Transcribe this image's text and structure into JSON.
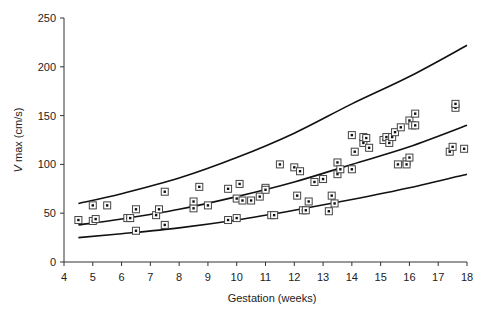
{
  "chart_data": {
    "type": "scatter",
    "title": "",
    "xlabel": "Gestation (weeks)",
    "ylabel_italic": "V",
    "ylabel_rest": " max (cm/s)",
    "ylabel": "V max (cm/s)",
    "xlim": [
      4,
      18
    ],
    "ylim": [
      0,
      250
    ],
    "xticks": [
      4,
      5,
      6,
      7,
      8,
      9,
      10,
      11,
      12,
      13,
      14,
      15,
      16,
      17,
      18
    ],
    "yticks": [
      0,
      50,
      100,
      150,
      200,
      250
    ],
    "grid": false,
    "legend": null,
    "marker": "square-with-dot",
    "series": [
      {
        "name": "observations",
        "type": "scatter",
        "points": [
          [
            4.5,
            43
          ],
          [
            5.0,
            58
          ],
          [
            5.0,
            42
          ],
          [
            5.1,
            44
          ],
          [
            5.5,
            58
          ],
          [
            6.2,
            45
          ],
          [
            6.3,
            45
          ],
          [
            6.5,
            32
          ],
          [
            6.5,
            54
          ],
          [
            7.2,
            48
          ],
          [
            7.3,
            54
          ],
          [
            7.5,
            38
          ],
          [
            7.5,
            72
          ],
          [
            8.5,
            55
          ],
          [
            8.5,
            62
          ],
          [
            8.7,
            77
          ],
          [
            9.0,
            58
          ],
          [
            9.7,
            43
          ],
          [
            9.7,
            75
          ],
          [
            10.0,
            45
          ],
          [
            10.0,
            65
          ],
          [
            10.1,
            80
          ],
          [
            10.2,
            63
          ],
          [
            10.5,
            63
          ],
          [
            10.8,
            67
          ],
          [
            11.0,
            76
          ],
          [
            11.0,
            74
          ],
          [
            11.2,
            48
          ],
          [
            11.3,
            48
          ],
          [
            11.5,
            100
          ],
          [
            12.0,
            97
          ],
          [
            12.1,
            68
          ],
          [
            12.2,
            93
          ],
          [
            12.3,
            53
          ],
          [
            12.4,
            53
          ],
          [
            12.5,
            62
          ],
          [
            12.7,
            82
          ],
          [
            13.0,
            85
          ],
          [
            13.2,
            52
          ],
          [
            13.3,
            68
          ],
          [
            13.4,
            60
          ],
          [
            13.5,
            90
          ],
          [
            13.5,
            102
          ],
          [
            13.6,
            95
          ],
          [
            14.0,
            95
          ],
          [
            14.0,
            130
          ],
          [
            14.1,
            113
          ],
          [
            14.4,
            122
          ],
          [
            14.4,
            128
          ],
          [
            14.5,
            127
          ],
          [
            14.6,
            117
          ],
          [
            15.1,
            125
          ],
          [
            15.2,
            128
          ],
          [
            15.3,
            122
          ],
          [
            15.4,
            128
          ],
          [
            15.5,
            133
          ],
          [
            15.6,
            100
          ],
          [
            15.7,
            138
          ],
          [
            15.9,
            103
          ],
          [
            15.9,
            100
          ],
          [
            16.0,
            107
          ],
          [
            16.0,
            145
          ],
          [
            16.1,
            140
          ],
          [
            16.2,
            152
          ],
          [
            16.2,
            140
          ],
          [
            17.4,
            113
          ],
          [
            17.5,
            118
          ],
          [
            17.6,
            158
          ],
          [
            17.6,
            162
          ],
          [
            17.9,
            116
          ]
        ]
      },
      {
        "name": "upper-reference",
        "type": "line",
        "points": [
          [
            4.5,
            60
          ],
          [
            6,
            70
          ],
          [
            8,
            86
          ],
          [
            10,
            107
          ],
          [
            12,
            132
          ],
          [
            14,
            162
          ],
          [
            16,
            190
          ],
          [
            18,
            222
          ]
        ]
      },
      {
        "name": "mean",
        "type": "line",
        "points": [
          [
            4.5,
            38
          ],
          [
            6,
            44
          ],
          [
            8,
            54
          ],
          [
            10,
            67
          ],
          [
            12,
            82
          ],
          [
            14,
            100
          ],
          [
            16,
            118
          ],
          [
            18,
            140
          ]
        ]
      },
      {
        "name": "lower-reference",
        "type": "line",
        "points": [
          [
            4.5,
            25
          ],
          [
            6,
            29
          ],
          [
            8,
            35
          ],
          [
            10,
            43
          ],
          [
            12,
            53
          ],
          [
            14,
            64
          ],
          [
            16,
            76
          ],
          [
            18,
            90
          ]
        ]
      }
    ]
  }
}
